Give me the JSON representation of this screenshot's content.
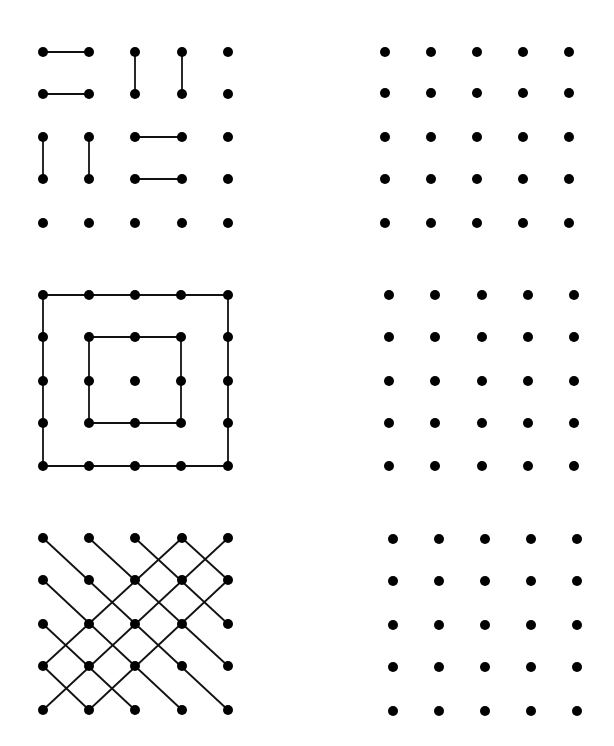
{
  "style": {
    "background": "#ffffff",
    "dot_color": "#000000",
    "line_color": "#111111",
    "dot_radius": 5,
    "line_width": 1.8
  },
  "puzzles": [
    {
      "id": "top-left",
      "label": "5x5 dot grid partitioned into dominoes",
      "xs": [
        43,
        89,
        135,
        182,
        228
      ],
      "ys": [
        52,
        94,
        137,
        179,
        223
      ],
      "edges": [
        [
          [
            0,
            0
          ],
          [
            1,
            0
          ]
        ],
        [
          [
            0,
            1
          ],
          [
            1,
            1
          ]
        ],
        [
          [
            2,
            0
          ],
          [
            2,
            1
          ]
        ],
        [
          [
            3,
            0
          ],
          [
            3,
            1
          ]
        ],
        [
          [
            0,
            2
          ],
          [
            0,
            3
          ]
        ],
        [
          [
            1,
            2
          ],
          [
            1,
            3
          ]
        ],
        [
          [
            2,
            2
          ],
          [
            3,
            2
          ]
        ],
        [
          [
            2,
            3
          ],
          [
            3,
            3
          ]
        ]
      ]
    },
    {
      "id": "top-right",
      "label": "Empty 5x5 dot grid",
      "xs": [
        385,
        431,
        477,
        523,
        569
      ],
      "ys": [
        52,
        93,
        137,
        179,
        223
      ],
      "edges": []
    },
    {
      "id": "middle-left",
      "label": "5x5 dot grid with nested squares",
      "xs": [
        43,
        89,
        135,
        181,
        228
      ],
      "ys": [
        295,
        337,
        381,
        423,
        466
      ],
      "polylines": [
        [
          [
            0,
            0
          ],
          [
            4,
            0
          ],
          [
            4,
            4
          ],
          [
            0,
            4
          ],
          [
            0,
            0
          ]
        ],
        [
          [
            1,
            1
          ],
          [
            3,
            1
          ],
          [
            3,
            3
          ],
          [
            1,
            3
          ],
          [
            1,
            1
          ]
        ]
      ],
      "edges": []
    },
    {
      "id": "middle-right",
      "label": "Empty 5x5 dot grid",
      "xs": [
        389,
        435,
        482,
        528,
        574
      ],
      "ys": [
        295,
        337,
        381,
        423,
        466
      ],
      "edges": []
    },
    {
      "id": "bottom-left",
      "label": "5x5 dot grid with diagonal lines",
      "xs": [
        43,
        89,
        135,
        182,
        228
      ],
      "ys": [
        538,
        580,
        624,
        666,
        710
      ],
      "edges": [
        [
          [
            0,
            0
          ],
          [
            4,
            4
          ]
        ],
        [
          [
            1,
            0
          ],
          [
            4,
            3
          ]
        ],
        [
          [
            2,
            0
          ],
          [
            4,
            2
          ]
        ],
        [
          [
            3,
            0
          ],
          [
            4,
            1
          ]
        ],
        [
          [
            0,
            1
          ],
          [
            3,
            4
          ]
        ],
        [
          [
            0,
            2
          ],
          [
            2,
            4
          ]
        ],
        [
          [
            0,
            3
          ],
          [
            1,
            4
          ]
        ],
        [
          [
            0,
            4
          ],
          [
            4,
            0
          ]
        ],
        [
          [
            0,
            3
          ],
          [
            3,
            0
          ]
        ],
        [
          [
            1,
            4
          ],
          [
            4,
            1
          ]
        ]
      ]
    },
    {
      "id": "bottom-right",
      "label": "Empty 5x5 dot grid",
      "xs": [
        393,
        439,
        485,
        531,
        577
      ],
      "ys": [
        539,
        581,
        625,
        667,
        711
      ],
      "edges": []
    }
  ]
}
